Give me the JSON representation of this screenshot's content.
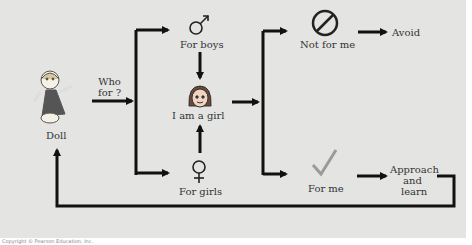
{
  "diagram": {
    "nodes": {
      "doll": "Doll",
      "who_for": "Who\nfor ?",
      "for_boys": "For boys",
      "i_am_a_girl": "I am a girl",
      "for_girls": "For girls",
      "not_for_me": "Not for me",
      "avoid": "Avoid",
      "for_me": "For me",
      "approach": "Approach",
      "and": "and",
      "learn": "learn"
    },
    "icons": {
      "doll": "doll-icon",
      "male": "male-symbol-icon",
      "girl": "girl-face-icon",
      "female": "female-symbol-icon",
      "prohibited": "prohibited-icon",
      "check": "checkmark-icon"
    },
    "colors": {
      "background": "#e4e4e2",
      "lines": "#111111",
      "check": "#999999"
    }
  },
  "caption": "Copyright © Pearson Education, Inc."
}
